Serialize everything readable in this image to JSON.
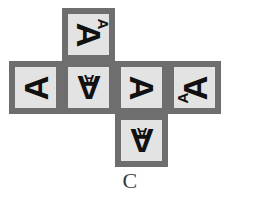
{
  "figure": {
    "caption": "C",
    "kind": "cube-net",
    "colors": {
      "face_fill": "#e3e3e3",
      "face_border": "#6e6e6e",
      "glyph": "#111111",
      "background": "#ffffff",
      "caption": "#3a3a3a"
    },
    "grid": {
      "columns": 4,
      "rows": 3,
      "cell_px": 53
    },
    "faces": [
      {
        "id": "face-top",
        "position": "top",
        "row": 1,
        "column": 2,
        "left_px": 62,
        "top_px": 8,
        "big_letter": "A",
        "big_rotation_deg": 90,
        "small_letter": "A",
        "small_rotation_deg": 90,
        "small_placement": "top-right"
      },
      {
        "id": "face-middle-1",
        "position": "middle-left",
        "row": 2,
        "column": 1,
        "left_px": 9,
        "top_px": 61,
        "big_letter": "A",
        "big_rotation_deg": 270,
        "small_letter": "",
        "small_rotation_deg": 0,
        "small_placement": "none"
      },
      {
        "id": "face-middle-2",
        "position": "middle-center-left",
        "row": 2,
        "column": 2,
        "left_px": 62,
        "top_px": 61,
        "big_letter": "A",
        "big_rotation_deg": 180,
        "small_letter": "A",
        "small_rotation_deg": 180,
        "small_placement": "center-upper"
      },
      {
        "id": "face-middle-3",
        "position": "middle-center-right",
        "row": 2,
        "column": 3,
        "left_px": 115,
        "top_px": 61,
        "big_letter": "A",
        "big_rotation_deg": 90,
        "small_letter": "",
        "small_rotation_deg": 0,
        "small_placement": "none"
      },
      {
        "id": "face-middle-4",
        "position": "middle-right",
        "row": 2,
        "column": 4,
        "left_px": 168,
        "top_px": 61,
        "big_letter": "A",
        "big_rotation_deg": 270,
        "small_letter": "A",
        "small_rotation_deg": 270,
        "small_placement": "bottom-left"
      },
      {
        "id": "face-bottom",
        "position": "bottom",
        "row": 3,
        "column": 3,
        "left_px": 115,
        "top_px": 114,
        "big_letter": "A",
        "big_rotation_deg": 180,
        "small_letter": "A",
        "small_rotation_deg": 180,
        "small_placement": "center-upper"
      }
    ]
  }
}
